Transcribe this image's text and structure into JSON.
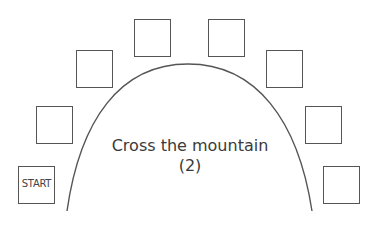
{
  "diagram": {
    "title_line1": "Cross the mountain",
    "title_line2": "(2)",
    "start_label": "START",
    "stroke_color": "#555555",
    "boxes": [
      {
        "id": "start",
        "label": "START",
        "x": 18,
        "y": 166
      },
      {
        "id": "left-1",
        "label": "",
        "x": 36,
        "y": 106
      },
      {
        "id": "left-2",
        "label": "",
        "x": 76,
        "y": 50
      },
      {
        "id": "left-3",
        "label": "",
        "x": 134,
        "y": 19
      },
      {
        "id": "right-3",
        "label": "",
        "x": 208,
        "y": 19
      },
      {
        "id": "right-2",
        "label": "",
        "x": 266,
        "y": 50
      },
      {
        "id": "right-1",
        "label": "",
        "x": 305,
        "y": 106
      },
      {
        "id": "right-0",
        "label": "",
        "x": 323,
        "y": 166
      }
    ]
  }
}
